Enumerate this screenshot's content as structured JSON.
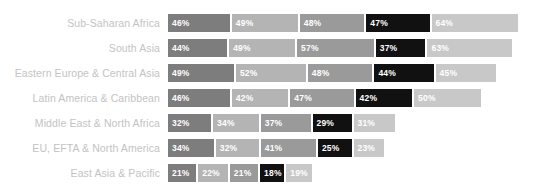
{
  "chart_data": {
    "type": "bar",
    "subtype": "stacked-horizontal",
    "title": "",
    "subtitle": "",
    "xlabel": "",
    "ylabel": "",
    "grid": false,
    "legend_position": "none",
    "axis_visible": false,
    "value_suffix": "%",
    "categories": [
      "Sub-Saharan Africa",
      "South Asia",
      "Eastern Europe & Central Asia",
      "Latin America & Caribbean",
      "Middle East & North Africa",
      "EU, EFTA & North America",
      "East Asia & Pacific"
    ],
    "series": [
      {
        "name": "series-1",
        "color": "#7d7d7d",
        "values": [
          46,
          44,
          49,
          46,
          32,
          34,
          21
        ]
      },
      {
        "name": "series-2",
        "color": "#b4b4b4",
        "values": [
          49,
          49,
          52,
          42,
          34,
          32,
          22
        ]
      },
      {
        "name": "series-3",
        "color": "#9a9a9a",
        "values": [
          48,
          57,
          48,
          47,
          37,
          41,
          21
        ]
      },
      {
        "name": "series-4",
        "color": "#111111",
        "values": [
          47,
          37,
          44,
          42,
          29,
          25,
          18
        ]
      },
      {
        "name": "series-5",
        "color": "#c8c8c8",
        "values": [
          64,
          63,
          45,
          50,
          31,
          23,
          19
        ]
      }
    ],
    "rows": [
      {
        "label": "Sub-Saharan Africa",
        "total": 254,
        "segments": [
          {
            "value": 46,
            "label": "46%",
            "color": "#7d7d7d"
          },
          {
            "value": 49,
            "label": "49%",
            "color": "#b4b4b4"
          },
          {
            "value": 48,
            "label": "48%",
            "color": "#9a9a9a"
          },
          {
            "value": 47,
            "label": "47%",
            "color": "#111111"
          },
          {
            "value": 64,
            "label": "64%",
            "color": "#c8c8c8"
          }
        ]
      },
      {
        "label": "South Asia",
        "total": 250,
        "segments": [
          {
            "value": 44,
            "label": "44%",
            "color": "#7d7d7d"
          },
          {
            "value": 49,
            "label": "49%",
            "color": "#b4b4b4"
          },
          {
            "value": 57,
            "label": "57%",
            "color": "#9a9a9a"
          },
          {
            "value": 37,
            "label": "37%",
            "color": "#111111"
          },
          {
            "value": 63,
            "label": "63%",
            "color": "#c8c8c8"
          }
        ]
      },
      {
        "label": "Eastern Europe & Central Asia",
        "total": 238,
        "segments": [
          {
            "value": 49,
            "label": "49%",
            "color": "#7d7d7d"
          },
          {
            "value": 52,
            "label": "52%",
            "color": "#b4b4b4"
          },
          {
            "value": 48,
            "label": "48%",
            "color": "#9a9a9a"
          },
          {
            "value": 44,
            "label": "44%",
            "color": "#111111"
          },
          {
            "value": 45,
            "label": "45%",
            "color": "#c8c8c8"
          }
        ]
      },
      {
        "label": "Latin America & Caribbean",
        "total": 227,
        "segments": [
          {
            "value": 46,
            "label": "46%",
            "color": "#7d7d7d"
          },
          {
            "value": 42,
            "label": "42%",
            "color": "#b4b4b4"
          },
          {
            "value": 47,
            "label": "47%",
            "color": "#9a9a9a"
          },
          {
            "value": 42,
            "label": "42%",
            "color": "#111111"
          },
          {
            "value": 50,
            "label": "50%",
            "color": "#c8c8c8"
          }
        ]
      },
      {
        "label": "Middle East & North Africa",
        "total": 163,
        "segments": [
          {
            "value": 32,
            "label": "32%",
            "color": "#7d7d7d"
          },
          {
            "value": 34,
            "label": "34%",
            "color": "#b4b4b4"
          },
          {
            "value": 37,
            "label": "37%",
            "color": "#9a9a9a"
          },
          {
            "value": 29,
            "label": "29%",
            "color": "#111111"
          },
          {
            "value": 31,
            "label": "31%",
            "color": "#c8c8c8"
          }
        ]
      },
      {
        "label": "EU, EFTA & North America",
        "total": 155,
        "segments": [
          {
            "value": 34,
            "label": "34%",
            "color": "#7d7d7d"
          },
          {
            "value": 32,
            "label": "32%",
            "color": "#b4b4b4"
          },
          {
            "value": 41,
            "label": "41%",
            "color": "#9a9a9a"
          },
          {
            "value": 25,
            "label": "25%",
            "color": "#111111"
          },
          {
            "value": 23,
            "label": "23%",
            "color": "#c8c8c8"
          }
        ]
      },
      {
        "label": "East Asia & Pacific",
        "total": 101,
        "segments": [
          {
            "value": 21,
            "label": "21%",
            "color": "#7d7d7d"
          },
          {
            "value": 22,
            "label": "22%",
            "color": "#b4b4b4"
          },
          {
            "value": 21,
            "label": "21%",
            "color": "#9a9a9a"
          },
          {
            "value": 18,
            "label": "18%",
            "color": "#111111"
          },
          {
            "value": 19,
            "label": "19%",
            "color": "#c8c8c8"
          }
        ]
      }
    ]
  },
  "style": {
    "label_color": "#c3c3c3",
    "value_color": "#ffffff",
    "background": "#ffffff",
    "px_per_percent": 1.345
  }
}
